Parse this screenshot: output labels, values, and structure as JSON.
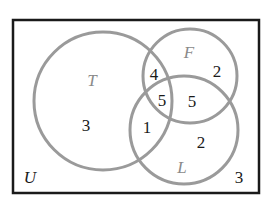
{
  "diagram": {
    "type": "venn",
    "universe": {
      "label": "U",
      "outside_count": "3"
    },
    "sets": [
      {
        "label": "T"
      },
      {
        "label": "F"
      },
      {
        "label": "L"
      }
    ],
    "regions": {
      "T_only": "3",
      "F_only": "2",
      "L_only": "2",
      "T_and_F_only": "4",
      "T_and_L_only": "1",
      "F_and_L_only": "5",
      "T_and_F_and_L": "5",
      "none": "3"
    },
    "colors": {
      "circle_stroke": "#9a9a9a",
      "frame_stroke": "#1a1a1a",
      "set_label": "#8a8a8a",
      "number": "#1a1a1a"
    }
  }
}
